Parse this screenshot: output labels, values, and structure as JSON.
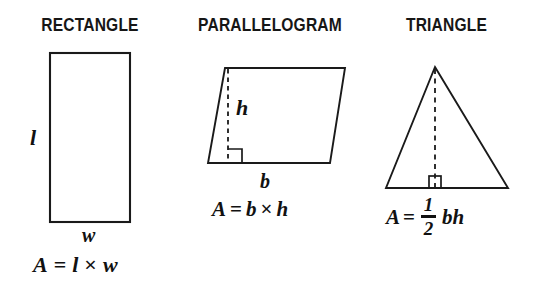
{
  "diagram": {
    "background_color": "#ffffff",
    "stroke_color": "#1a1a1a"
  },
  "shapes": [
    {
      "name": "rectangle",
      "title": "RECTANGLE",
      "labels": {
        "side_vertical": "l",
        "side_horizontal": "w"
      },
      "formula": {
        "lhs": "A",
        "equals": "=",
        "first_term": "l",
        "operator": "×",
        "second_term": "w",
        "plain": "A = l × w"
      }
    },
    {
      "name": "parallelogram",
      "title": "PARALLELOGRAM",
      "labels": {
        "height": "h",
        "base": "b"
      },
      "markers": {
        "height_line_style": "dashed",
        "right_angle": "right-angle-marker"
      },
      "formula": {
        "lhs": "A",
        "equals": "=",
        "first_term": "b",
        "operator": "×",
        "second_term": "h",
        "plain": "A= b × h"
      }
    },
    {
      "name": "triangle",
      "title": "TRIANGLE",
      "labels": {},
      "markers": {
        "height_line_style": "dashed",
        "right_angle": "right-angle-marker"
      },
      "formula": {
        "lhs": "A",
        "equals": "=",
        "fraction_numerator": "1",
        "fraction_denominator": "2",
        "trailing_terms": "bh",
        "plain": "A= 1/2 bh"
      }
    }
  ]
}
